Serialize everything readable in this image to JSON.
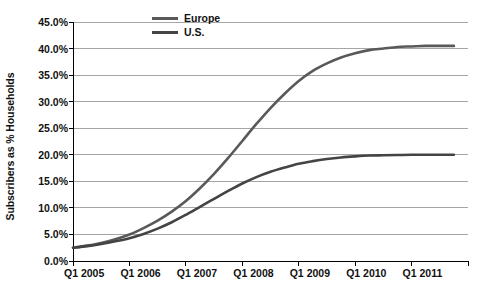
{
  "chart_data": {
    "type": "line",
    "title": "",
    "subtitle": "",
    "xlabel": "",
    "ylabel": "Subscribers as % Households",
    "grid": true,
    "legend_position": "top-center",
    "ylim": [
      0,
      45
    ],
    "ytick_labels": [
      "45.0%",
      "40.0%",
      "35.0%",
      "30.0%",
      "25.0%",
      "20.0%",
      "15.0%",
      "10.0%",
      "5.0%",
      "0.0%"
    ],
    "ytick_values": [
      45,
      40,
      35,
      30,
      25,
      20,
      15,
      10,
      5,
      0
    ],
    "xtick_labels": [
      "Q1 2005",
      "Q1 2006",
      "Q1 2007",
      "Q1 2008",
      "Q1 2009",
      "Q1 2010",
      "Q1 2011"
    ],
    "x": [
      2005.0,
      2005.25,
      2005.5,
      2005.75,
      2006.0,
      2006.25,
      2006.5,
      2006.75,
      2007.0,
      2007.25,
      2007.5,
      2007.75,
      2008.0,
      2008.25,
      2008.5,
      2008.75,
      2009.0,
      2009.25,
      2009.5,
      2009.75,
      2010.0,
      2010.25,
      2010.5,
      2010.75,
      2011.0,
      2011.25,
      2011.5,
      2011.75
    ],
    "series": [
      {
        "name": "Europe",
        "color": "#595959",
        "values": [
          2.5,
          2.9,
          3.4,
          4.1,
          5.0,
          6.2,
          7.6,
          9.3,
          11.3,
          13.7,
          16.4,
          19.4,
          22.6,
          25.8,
          28.8,
          31.5,
          33.9,
          35.8,
          37.2,
          38.3,
          39.1,
          39.7,
          40.0,
          40.3,
          40.4,
          40.5,
          40.5,
          40.5
        ]
      },
      {
        "name": "U.S.",
        "color": "#444444",
        "values": [
          2.5,
          2.8,
          3.2,
          3.7,
          4.3,
          5.1,
          6.1,
          7.3,
          8.7,
          10.2,
          11.7,
          13.2,
          14.6,
          15.8,
          16.8,
          17.6,
          18.3,
          18.8,
          19.2,
          19.5,
          19.7,
          19.85,
          19.9,
          19.95,
          20.0,
          20.0,
          20.0,
          20.0
        ]
      }
    ],
    "legend": [
      {
        "label": "Europe",
        "swatch_color": "#595959",
        "name": "legend-item-europe"
      },
      {
        "label": "U.S.",
        "swatch_color": "#444444",
        "name": "legend-item-us"
      }
    ],
    "axis_color": "#000000",
    "grid_color": "#a6a6a6",
    "plot_area": {
      "left": 73,
      "right": 468,
      "top": 22,
      "bottom": 261
    }
  }
}
